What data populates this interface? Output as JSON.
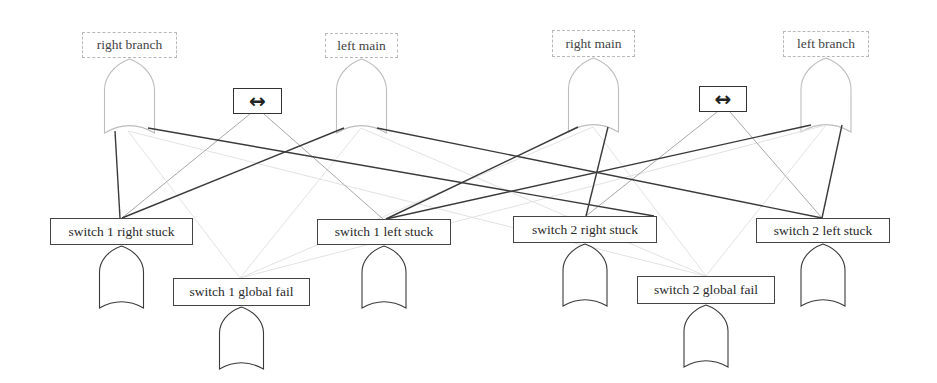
{
  "diagram": {
    "type": "fault-tree / dependency graph",
    "top_events": [
      {
        "id": "right_branch",
        "label": "right branch",
        "x": 82,
        "y": 32,
        "w": 95,
        "h": 26,
        "gate": "or",
        "style": "faded"
      },
      {
        "id": "left_main",
        "label": "left main",
        "x": 325,
        "y": 33,
        "w": 73,
        "h": 25,
        "gate": "or",
        "style": "faded"
      },
      {
        "id": "right_main",
        "label": "right main",
        "x": 552,
        "y": 30,
        "w": 83,
        "h": 27,
        "gate": "or",
        "style": "faded"
      },
      {
        "id": "left_branch",
        "label": "left branch",
        "x": 783,
        "y": 31,
        "w": 86,
        "h": 26,
        "gate": "or",
        "style": "faded"
      }
    ],
    "equivalence_nodes": [
      {
        "id": "equiv_1",
        "label": "↔",
        "symbol_name": "left-right-arrow",
        "x": 233,
        "y": 88,
        "w": 49,
        "h": 26
      },
      {
        "id": "equiv_2",
        "label": "↔",
        "symbol_name": "left-right-arrow",
        "x": 699,
        "y": 86,
        "w": 48,
        "h": 26
      }
    ],
    "basic_events": [
      {
        "id": "s1_right_stuck",
        "label": "switch 1 right stuck",
        "x": 50,
        "y": 218,
        "w": 143,
        "h": 27,
        "gate": "or"
      },
      {
        "id": "s1_left_stuck",
        "label": "switch 1 left stuck",
        "x": 317,
        "y": 219,
        "w": 134,
        "h": 26,
        "gate": "or"
      },
      {
        "id": "s2_right_stuck",
        "label": "switch 2 right stuck",
        "x": 513,
        "y": 216,
        "w": 144,
        "h": 27,
        "gate": "or"
      },
      {
        "id": "s2_left_stuck",
        "label": "switch 2 left stuck",
        "x": 756,
        "y": 218,
        "w": 134,
        "h": 25,
        "gate": "or"
      },
      {
        "id": "s1_global_fail",
        "label": "switch 1 global fail",
        "x": 173,
        "y": 278,
        "w": 137,
        "h": 28,
        "gate": "or"
      },
      {
        "id": "s2_global_fail",
        "label": "switch 2 global fail",
        "x": 637,
        "y": 276,
        "w": 138,
        "h": 28,
        "gate": "or"
      }
    ],
    "edges": {
      "strong": [
        [
          115,
          131,
          120,
          218
        ],
        [
          148,
          128,
          654,
          216
        ],
        [
          344,
          128,
          122,
          218
        ],
        [
          377,
          128,
          822,
          218
        ],
        [
          578,
          127,
          386,
          219
        ],
        [
          608,
          127,
          586,
          216
        ],
        [
          811,
          125,
          386,
          219
        ],
        [
          842,
          125,
          822,
          218
        ]
      ],
      "light": [
        [
          250,
          114,
          122,
          218
        ],
        [
          264,
          114,
          383,
          219
        ],
        [
          717,
          112,
          586,
          216
        ],
        [
          730,
          112,
          822,
          218
        ]
      ],
      "faint": [
        [
          128,
          131,
          240,
          278
        ],
        [
          361,
          128,
          240,
          278
        ],
        [
          593,
          127,
          240,
          278
        ],
        [
          128,
          131,
          706,
          276
        ],
        [
          826,
          125,
          706,
          276
        ],
        [
          361,
          128,
          706,
          276
        ],
        [
          593,
          127,
          706,
          276
        ],
        [
          826,
          125,
          240,
          278
        ]
      ]
    },
    "colors": {
      "strong_edge": "#3a3a3a",
      "light_edge": "#a8a8a8",
      "faint_edge": "#e2e2e2",
      "faded_gate": "#bdbdbd",
      "solid_gate": "#3a3a3a"
    }
  }
}
